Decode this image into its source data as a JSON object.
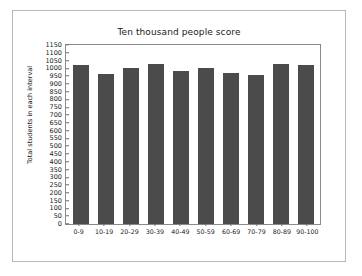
{
  "chart_data": {
    "type": "bar",
    "title": "Ten thousand people score",
    "xlabel": "",
    "ylabel": "Total students in each interval",
    "categories": [
      "0-9",
      "10-19",
      "20-29",
      "30-39",
      "40-49",
      "50-59",
      "60-69",
      "70-79",
      "80-89",
      "90-100"
    ],
    "values": [
      1020,
      965,
      1000,
      1030,
      985,
      1005,
      968,
      955,
      1028,
      1020
    ],
    "ylim": [
      0,
      1150
    ],
    "ytick_step": 50,
    "yticks": [
      0,
      50,
      100,
      150,
      200,
      250,
      300,
      350,
      400,
      450,
      500,
      550,
      600,
      650,
      700,
      750,
      800,
      850,
      900,
      950,
      1000,
      1050,
      1100,
      1150
    ],
    "grid": false,
    "legend": null,
    "bar_color": "#4b4b4b",
    "frame_color": "#8a8a8a",
    "background": "#ffffff"
  }
}
